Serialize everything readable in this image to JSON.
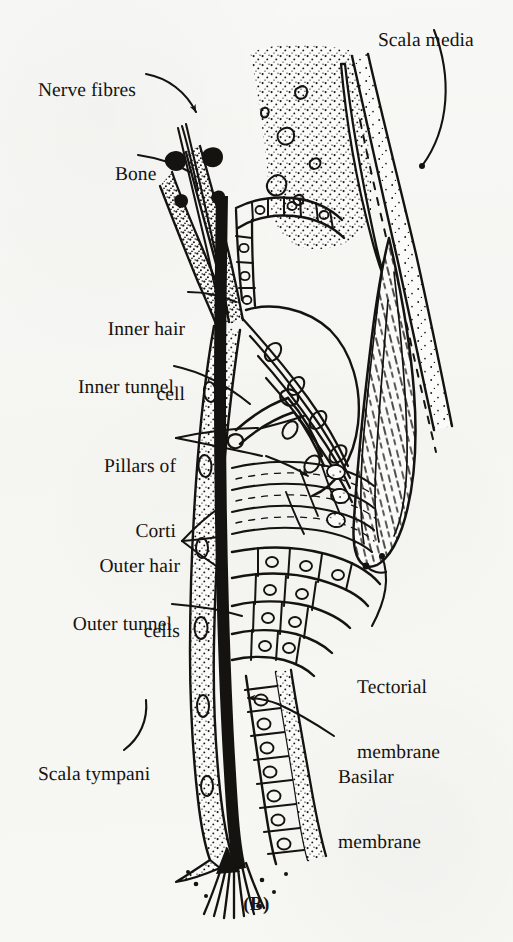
{
  "figure": {
    "caption": "(B)",
    "ink_color": "#15130f",
    "paper_color": "#f7f7f4",
    "width": 513,
    "height": 942
  },
  "labels": [
    {
      "id": "nerve-fibres",
      "text": "Nerve fibres",
      "lines": [
        "Nerve fibres"
      ],
      "x": 18,
      "y": 58,
      "align": "left",
      "leader": "curved-arrow"
    },
    {
      "id": "bone",
      "text": "Bone",
      "lines": [
        "Bone"
      ],
      "x": 95,
      "y": 142,
      "align": "left",
      "leader": "line"
    },
    {
      "id": "scala-media",
      "text": "Scala media",
      "lines": [
        "Scala media"
      ],
      "x": 358,
      "y": 8,
      "align": "left",
      "leader": "curve"
    },
    {
      "id": "inner-hair-cell",
      "text": "Inner hair cell",
      "lines": [
        "Inner hair",
        "cell"
      ],
      "x": 75,
      "y": 275,
      "align": "right",
      "leader": "line"
    },
    {
      "id": "inner-tunnel",
      "text": "Inner tunnel",
      "lines": [
        "Inner tunnel"
      ],
      "x": 48,
      "y": 355,
      "align": "right",
      "leader": "line"
    },
    {
      "id": "pillars-of-corti",
      "text": "Pillars of Corti",
      "lines": [
        "Pillars of",
        "Corti"
      ],
      "x": 86,
      "y": 412,
      "align": "right",
      "leader": "double-arrow"
    },
    {
      "id": "outer-hair-cells",
      "text": "Outer hair cells",
      "lines": [
        "Outer hair",
        "cells"
      ],
      "x": 78,
      "y": 512,
      "align": "right",
      "leader": "triple-arrow"
    },
    {
      "id": "outer-tunnel",
      "text": "Outer tunnel",
      "lines": [
        "Outer tunnel"
      ],
      "x": 45,
      "y": 592,
      "align": "right",
      "leader": "line"
    },
    {
      "id": "tectorial-membrane",
      "text": "Tectorial membrane",
      "lines": [
        "Tectorial",
        "membrane"
      ],
      "x": 357,
      "y": 633,
      "align": "left",
      "leader": "curve"
    },
    {
      "id": "basilar-membrane",
      "text": "Basilar membrane",
      "lines": [
        "Basilar",
        "membrane"
      ],
      "x": 338,
      "y": 723,
      "align": "left",
      "leader": "line-arrow"
    },
    {
      "id": "scala-tympani",
      "text": "Scala tympani",
      "lines": [
        "Scala tympani"
      ],
      "x": 18,
      "y": 742,
      "align": "left",
      "leader": "curve"
    }
  ]
}
